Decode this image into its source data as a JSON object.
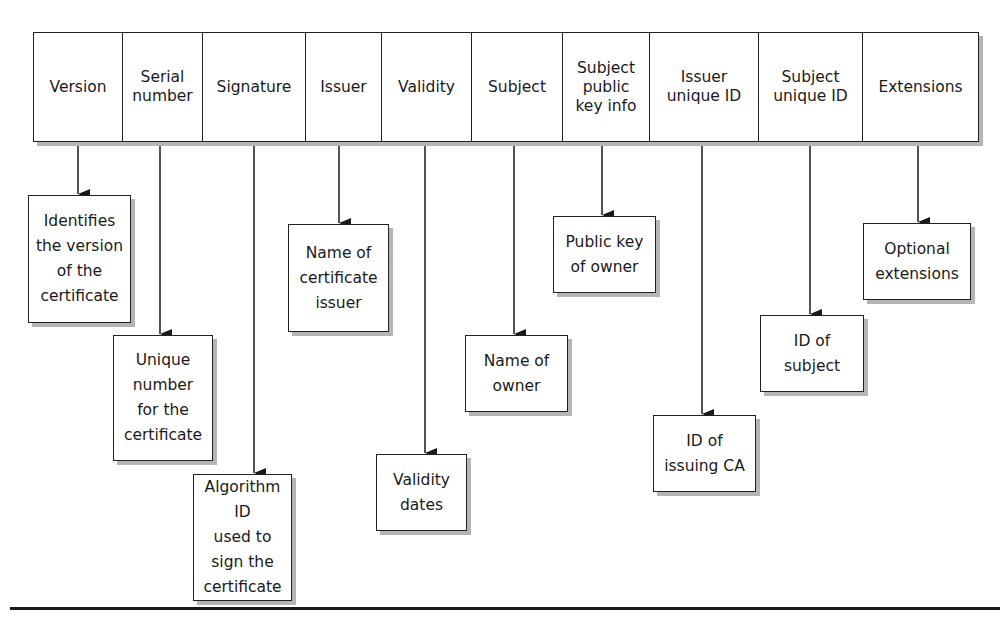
{
  "diagram": {
    "fields": [
      {
        "label": "Version",
        "description": "Identifies\nthe version\nof the\ncertificate"
      },
      {
        "label": "Serial\nnumber",
        "description": "Unique\nnumber\nfor the\ncertificate"
      },
      {
        "label": "Signature",
        "description": "Algorithm ID\nused to\nsign  the\ncertificate"
      },
      {
        "label": "Issuer",
        "description": "Name of\ncertificate\nissuer"
      },
      {
        "label": "Validity",
        "description": "Validity\ndates"
      },
      {
        "label": "Subject",
        "description": "Name of\nowner"
      },
      {
        "label": "Subject\npublic\nkey info",
        "description": "Public key\nof owner"
      },
      {
        "label": "Issuer\nunique ID",
        "description": "ID of\nissuing CA"
      },
      {
        "label": "Subject\nunique ID",
        "description": "ID of\nsubject"
      },
      {
        "label": "Extensions",
        "description": "Optional\nextensions"
      }
    ],
    "colors": {
      "line": "#1a1a1a",
      "shadow": "#b5b5b5",
      "background": "#ffffff"
    }
  }
}
